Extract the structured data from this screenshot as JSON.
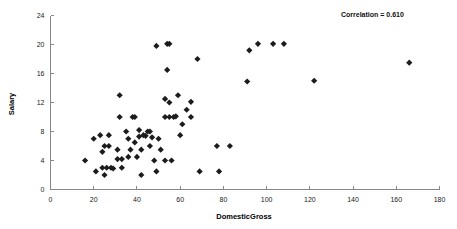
{
  "chart_data": {
    "type": "scatter",
    "title": "",
    "xlabel": "DomesticGross",
    "ylabel": "Salary",
    "xlim": [
      0,
      180
    ],
    "ylim": [
      0,
      24
    ],
    "xticks": [
      0,
      20,
      40,
      60,
      80,
      100,
      120,
      140,
      160,
      180
    ],
    "yticks": [
      0,
      4,
      8,
      12,
      16,
      20,
      24
    ],
    "grid": false,
    "legend": null,
    "annotations": [
      {
        "name": "correlation-annotation",
        "text": "Correlation = 0.610"
      }
    ],
    "marker": {
      "shape": "diamond",
      "color": "#1c1c1c",
      "size": 4
    },
    "points": [
      {
        "x": 16,
        "y": 4.0
      },
      {
        "x": 20,
        "y": 7.0
      },
      {
        "x": 21,
        "y": 2.5
      },
      {
        "x": 23,
        "y": 7.5
      },
      {
        "x": 24,
        "y": 5.2
      },
      {
        "x": 24,
        "y": 3.0
      },
      {
        "x": 25,
        "y": 6.0
      },
      {
        "x": 25,
        "y": 2.0
      },
      {
        "x": 26,
        "y": 3.0
      },
      {
        "x": 27,
        "y": 7.5
      },
      {
        "x": 27,
        "y": 6.0
      },
      {
        "x": 28,
        "y": 3.0
      },
      {
        "x": 29,
        "y": 2.9
      },
      {
        "x": 31,
        "y": 5.5
      },
      {
        "x": 31,
        "y": 4.2
      },
      {
        "x": 32,
        "y": 10.0
      },
      {
        "x": 32,
        "y": 13.0
      },
      {
        "x": 33,
        "y": 4.2
      },
      {
        "x": 33,
        "y": 3.0
      },
      {
        "x": 35,
        "y": 8.0
      },
      {
        "x": 36,
        "y": 7.0
      },
      {
        "x": 36,
        "y": 4.5
      },
      {
        "x": 37,
        "y": 5.5
      },
      {
        "x": 38,
        "y": 10.0
      },
      {
        "x": 39,
        "y": 10.0
      },
      {
        "x": 39,
        "y": 6.5
      },
      {
        "x": 40,
        "y": 4.5
      },
      {
        "x": 41,
        "y": 8.2
      },
      {
        "x": 41,
        "y": 7.3
      },
      {
        "x": 42,
        "y": 5.5
      },
      {
        "x": 42,
        "y": 2.0
      },
      {
        "x": 43,
        "y": 7.5
      },
      {
        "x": 44,
        "y": 7.4
      },
      {
        "x": 45,
        "y": 8.0
      },
      {
        "x": 46,
        "y": 8.0
      },
      {
        "x": 46,
        "y": 6.0
      },
      {
        "x": 47,
        "y": 7.2
      },
      {
        "x": 48,
        "y": 4.0
      },
      {
        "x": 49,
        "y": 19.8
      },
      {
        "x": 49,
        "y": 2.5
      },
      {
        "x": 50,
        "y": 7.0
      },
      {
        "x": 51,
        "y": 5.5
      },
      {
        "x": 53,
        "y": 12.5
      },
      {
        "x": 53,
        "y": 10.0
      },
      {
        "x": 53,
        "y": 4.0
      },
      {
        "x": 54,
        "y": 20.1
      },
      {
        "x": 54,
        "y": 16.5
      },
      {
        "x": 55,
        "y": 20.1
      },
      {
        "x": 55,
        "y": 12.0
      },
      {
        "x": 55,
        "y": 10.0
      },
      {
        "x": 56,
        "y": 4.0
      },
      {
        "x": 57,
        "y": 10.0
      },
      {
        "x": 58,
        "y": 10.1
      },
      {
        "x": 59,
        "y": 13.0
      },
      {
        "x": 60,
        "y": 7.5
      },
      {
        "x": 61,
        "y": 9.0
      },
      {
        "x": 63,
        "y": 11.0
      },
      {
        "x": 65,
        "y": 12.1
      },
      {
        "x": 65,
        "y": 10.0
      },
      {
        "x": 68,
        "y": 18.0
      },
      {
        "x": 69,
        "y": 2.5
      },
      {
        "x": 77,
        "y": 6.0
      },
      {
        "x": 78,
        "y": 2.5
      },
      {
        "x": 83,
        "y": 6.0
      },
      {
        "x": 91,
        "y": 14.9
      },
      {
        "x": 92,
        "y": 19.2
      },
      {
        "x": 96,
        "y": 20.1
      },
      {
        "x": 103,
        "y": 20.1
      },
      {
        "x": 108,
        "y": 20.1
      },
      {
        "x": 122,
        "y": 15.0
      },
      {
        "x": 166,
        "y": 17.5
      }
    ]
  }
}
